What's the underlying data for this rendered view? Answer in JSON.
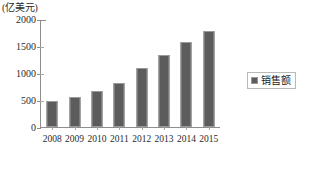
{
  "chart_data": {
    "type": "bar",
    "title": "",
    "subtitle": "",
    "unit_label": "(亿美元)",
    "xlabel": "",
    "ylabel": "",
    "categories": [
      "2008",
      "2009",
      "2010",
      "2011",
      "2012",
      "2013",
      "2014",
      "2015"
    ],
    "values": [
      480,
      570,
      680,
      830,
      1100,
      1350,
      1580,
      1800
    ],
    "series": [
      {
        "name": "销售额",
        "values": [
          480,
          570,
          680,
          830,
          1100,
          1350,
          1580,
          1800
        ],
        "color": "#5c5c5c"
      }
    ],
    "ylim": [
      0,
      2000
    ],
    "yticks": [
      0,
      500,
      1000,
      1500,
      2000
    ],
    "ytick_labels": [
      "0",
      "500",
      "1000",
      "1500",
      "2000"
    ],
    "grid": false,
    "legend": {
      "position": "right",
      "entries": [
        {
          "label": "销售额",
          "color": "#5c5c5c",
          "marker": "square"
        }
      ]
    },
    "colors": {
      "bar": "#5c5c5c",
      "bar_border": "#9a9a9a",
      "axis": "#8e8e8e",
      "text": "#1a1a1a",
      "background": "#ffffff",
      "legend_border": "#b9b9b9"
    }
  }
}
